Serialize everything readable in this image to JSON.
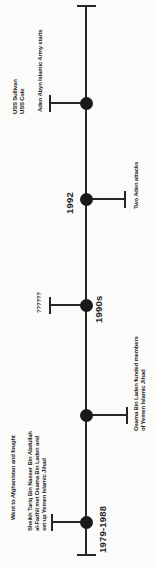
{
  "timeline": {
    "background_color": "#fbfbfa",
    "ink_color": "#262626",
    "orientation": "vertical, labels rotated -90deg (read bottom-to-top)",
    "events": [
      {
        "name": "uss-attacks-aden-army",
        "year": "",
        "labels": {
          "uss": [
            "USS Sullivan",
            "USS Cole"
          ],
          "army": [
            "Aden Abyn Islamic Army starts"
          ]
        }
      },
      {
        "name": "aden-attacks",
        "year": "1992",
        "labels": {
          "attacks": [
            "Two Aden attacks"
          ]
        }
      },
      {
        "name": "unknown",
        "year": "1990s",
        "labels": {
          "unknown": [
            "??????"
          ]
        }
      },
      {
        "name": "bin-laden-funding",
        "year": "",
        "labels": {
          "funding": [
            "Osama Bin Laden funded members",
            "of Yemen Islamic Jihad"
          ]
        }
      },
      {
        "name": "origins",
        "year": "1979-1988",
        "labels": {
          "afghanistan": [
            "Went to Afghanistan and fought"
          ],
          "sheikh": [
            "Sheikh Tariq Bin Nasser Bin Abdullah",
            "al-Fadhli met Osama Bin Laden and",
            "set up Yemen Islamic Jihad"
          ]
        }
      }
    ]
  }
}
